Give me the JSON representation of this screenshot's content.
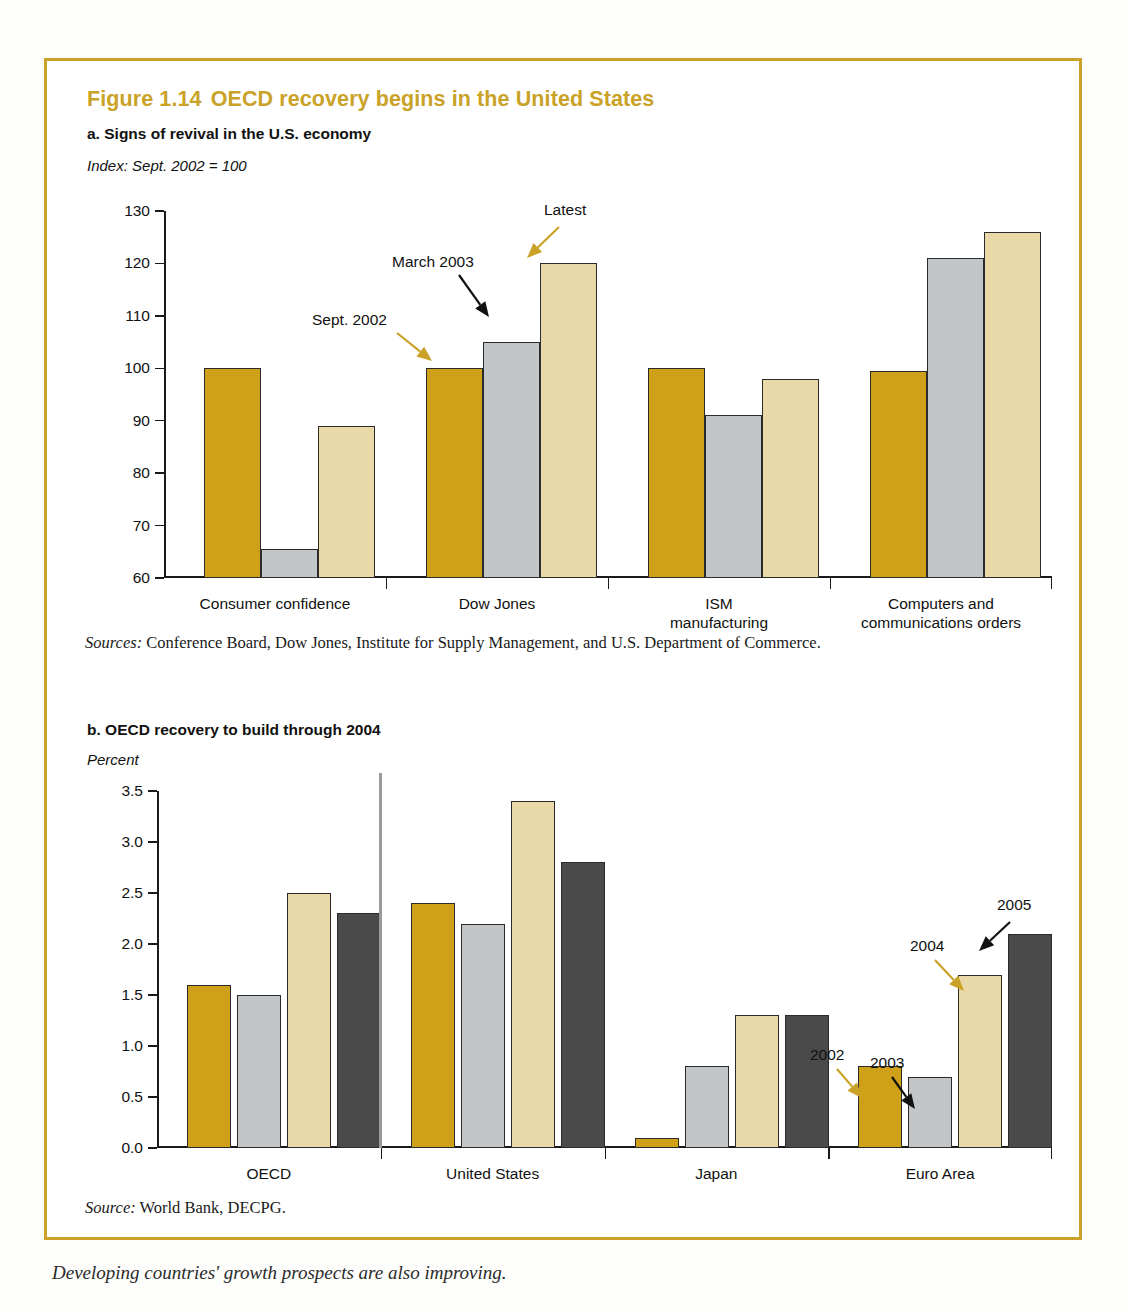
{
  "figure": {
    "number": "Figure 1.14",
    "title": "OECD recovery begins in the United States"
  },
  "panel_a": {
    "title": "a. Signs of revival in the U.S. economy",
    "axis_unit": "Index: Sept. 2002 = 100",
    "source_label": "Sources:",
    "source_text": " Conference Board, Dow Jones, Institute for Supply Management, and U.S. Department of Commerce.",
    "annotations": [
      {
        "label": "Sept. 2002",
        "arrow_color": "#c9a227"
      },
      {
        "label": "March 2003",
        "arrow_color": "#111111"
      },
      {
        "label": "Latest",
        "arrow_color": "#c9a227"
      }
    ]
  },
  "panel_b": {
    "title": "b. OECD recovery to build through 2004",
    "axis_unit": "Percent",
    "source_label": "Source:",
    "source_text": " World Bank, DECPG.",
    "annotations": [
      {
        "label": "2002",
        "arrow_color": "#c9a227"
      },
      {
        "label": "2003",
        "arrow_color": "#111111"
      },
      {
        "label": "2004",
        "arrow_color": "#c9a227"
      },
      {
        "label": "2005",
        "arrow_color": "#111111"
      }
    ]
  },
  "colors": {
    "frame": "#c9a227",
    "title": "#c9a227",
    "series_gold": "#cfa119",
    "series_gray": "#c3c6c8",
    "series_cream": "#ead9a8",
    "series_charcoal": "#4a4a4a"
  },
  "chart_data": [
    {
      "type": "bar",
      "title": "a. Signs of revival in the U.S. economy",
      "subtitle": "Index: Sept. 2002 = 100",
      "xlabel": "",
      "ylabel": "Index: Sept. 2002 = 100",
      "ylim": [
        60,
        130
      ],
      "yticks": [
        60,
        70,
        80,
        90,
        100,
        110,
        120,
        130
      ],
      "ytick_labels": [
        "60",
        "70",
        "80",
        "90",
        "100",
        "110",
        "120",
        "130"
      ],
      "grid": false,
      "legend": "none",
      "categories": [
        "Consumer confidence",
        "Dow Jones",
        "ISM manufacturing",
        "Computers and communications orders"
      ],
      "category_lines": [
        [
          "Consumer confidence"
        ],
        [
          "Dow Jones"
        ],
        [
          "ISM",
          "manufacturing"
        ],
        [
          "Computers and",
          "communications orders"
        ]
      ],
      "series": [
        {
          "name": "Sept. 2002",
          "color": "#cfa119",
          "values": [
            100,
            100,
            100,
            99.5
          ]
        },
        {
          "name": "March 2003",
          "color": "#c3c6c8",
          "values": [
            65.5,
            105,
            91,
            121
          ]
        },
        {
          "name": "Latest",
          "color": "#ead9a8",
          "values": [
            89,
            120,
            98,
            126
          ]
        }
      ]
    },
    {
      "type": "bar",
      "title": "b. OECD recovery to build through 2004",
      "subtitle": "Percent",
      "xlabel": "",
      "ylabel": "Percent",
      "ylim": [
        0.0,
        3.5
      ],
      "yticks": [
        0.0,
        0.5,
        1.0,
        1.5,
        2.0,
        2.5,
        3.0,
        3.5
      ],
      "ytick_labels": [
        "0.0",
        "0.5",
        "1.0",
        "1.5",
        "2.0",
        "2.5",
        "3.0",
        "3.5"
      ],
      "grid": false,
      "legend": "none",
      "categories": [
        "OECD",
        "United States",
        "Japan",
        "Euro Area"
      ],
      "category_lines": [
        [
          "OECD"
        ],
        [
          "United States"
        ],
        [
          "Japan"
        ],
        [
          "Euro Area"
        ]
      ],
      "series": [
        {
          "name": "2002",
          "color": "#cfa119",
          "values": [
            1.6,
            2.4,
            0.1,
            0.8
          ]
        },
        {
          "name": "2003",
          "color": "#c3c6c8",
          "values": [
            1.5,
            2.2,
            0.8,
            0.7
          ]
        },
        {
          "name": "2004",
          "color": "#ead9a8",
          "values": [
            2.5,
            3.4,
            1.3,
            1.7
          ]
        },
        {
          "name": "2005",
          "color": "#4a4a4a",
          "values": [
            2.3,
            2.8,
            1.3,
            2.1
          ]
        }
      ]
    }
  ],
  "caption_below": "Developing countries' growth prospects are also improving."
}
